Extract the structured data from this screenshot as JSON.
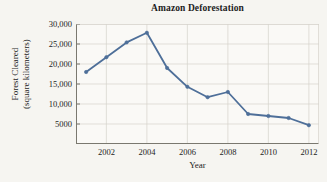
{
  "chart_data": {
    "type": "line",
    "title": "Amazon Deforestation",
    "xlabel": "Year",
    "ylabel_line1": "Forest Cleared",
    "ylabel_line2": "(square kilometers)",
    "x": [
      2001,
      2002,
      2003,
      2004,
      2005,
      2006,
      2007,
      2008,
      2009,
      2010,
      2011,
      2012
    ],
    "values": [
      18000,
      21700,
      25400,
      27800,
      19000,
      14300,
      11700,
      13000,
      7500,
      7000,
      6500,
      4700
    ],
    "series": [
      {
        "name": "Forest Cleared",
        "values": [
          18000,
          21700,
          25400,
          27800,
          19000,
          14300,
          11700,
          13000,
          7500,
          7000,
          6500,
          4700
        ]
      }
    ],
    "xlim": [
      2000.5,
      2012.5
    ],
    "ylim": [
      0,
      30000
    ],
    "x_ticks": [
      2001,
      2002,
      2003,
      2004,
      2005,
      2006,
      2007,
      2008,
      2009,
      2010,
      2011,
      2012
    ],
    "x_tick_labels_shown": [
      "2002",
      "2004",
      "2006",
      "2008",
      "2010",
      "2012"
    ],
    "x_tick_labels_shown_values": [
      2002,
      2004,
      2006,
      2008,
      2010,
      2012
    ],
    "y_ticks": [
      5000,
      10000,
      15000,
      20000,
      25000,
      30000
    ],
    "y_tick_labels": [
      "5000",
      "10,000",
      "15,000",
      "20,000",
      "25,000",
      "30,000"
    ],
    "grid": true,
    "legend": null,
    "line_color": "#4e6f99",
    "marker": "circle",
    "marker_color": "#4e6f99",
    "grid_color": "#d6d3cb",
    "axis_color": "#7a786f",
    "plot_background": "#faf9f6",
    "page_background": "#f6f5f1",
    "text_color": "#1d1d1d"
  }
}
